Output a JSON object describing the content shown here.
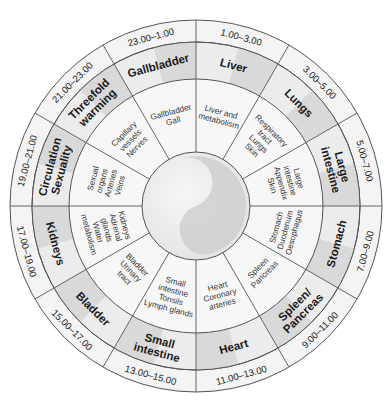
{
  "diagram": {
    "center": {
      "cx": 196,
      "cy": 206
    },
    "radii": {
      "outer": 186,
      "time_inner": 164,
      "organ_inner": 127,
      "core": 54
    },
    "colors": {
      "line": "#555555",
      "time_ring": "#f4f4f4",
      "organ_ring": "#ececec",
      "organ_shade": "#d9d9d9",
      "detail_ring": "#f7f7f7",
      "core_light": "#eeeeee",
      "core_dark": "#cfcfcf"
    },
    "segments": [
      {
        "time": "1.00–3.00",
        "organ": [
          "Liver"
        ],
        "details": [
          "Liver and",
          "metabolism"
        ]
      },
      {
        "time": "3.00–5.00",
        "organ": [
          "Lungs"
        ],
        "details": [
          "Respiratory",
          "tract",
          "Lungs",
          "Skin"
        ]
      },
      {
        "time": "5.00–7.00",
        "organ": [
          "Large",
          "intestine"
        ],
        "details": [
          "Large",
          "intestine",
          "Appendix",
          "Skin"
        ]
      },
      {
        "time": "7.00–9.00",
        "organ": [
          "Stomach"
        ],
        "details": [
          "Stomach",
          "Duodenum",
          "Oesophagus"
        ]
      },
      {
        "time": "9.00–11.00",
        "organ": [
          "Spleen/",
          "Pancreas"
        ],
        "details": [
          "Spleen",
          "Pancreas"
        ]
      },
      {
        "time": "11.00–13.00",
        "organ": [
          "Heart"
        ],
        "details": [
          "Heart",
          "Coronary",
          "arteries"
        ]
      },
      {
        "time": "13.00–15.00",
        "organ": [
          "Small",
          "intestine"
        ],
        "details": [
          "Small",
          "intestine",
          "Tonsils",
          "Lymph glands"
        ]
      },
      {
        "time": "15.00–17.00",
        "organ": [
          "Bladder"
        ],
        "details": [
          "Bladder",
          "Urinary",
          "tract"
        ]
      },
      {
        "time": "17.00–19.00",
        "organ": [
          "Kidneys"
        ],
        "details": [
          "Kidneys",
          "Adrenal",
          "glands",
          "Water",
          "metabolism"
        ]
      },
      {
        "time": "19.00–21.00",
        "organ": [
          "Circulation",
          "Sexuality"
        ],
        "details": [
          "Sexual",
          "organs",
          "Arteries",
          "Veins"
        ]
      },
      {
        "time": "21.00–23.00",
        "organ": [
          "Threefold",
          "warming"
        ],
        "details": [
          "Capillary",
          "vessels",
          "Nerves"
        ]
      },
      {
        "time": "23.00–1.00",
        "organ": [
          "Gallbladder"
        ],
        "details": [
          "Gallbladder",
          "Gall"
        ]
      }
    ]
  }
}
